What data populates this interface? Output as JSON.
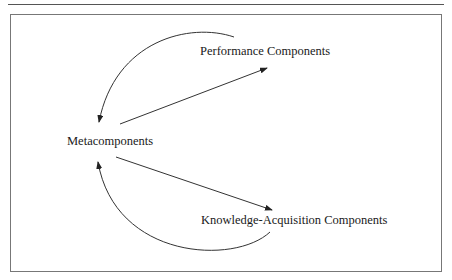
{
  "diagram": {
    "nodes": [
      {
        "id": "performance",
        "label": "Performance Components"
      },
      {
        "id": "meta",
        "label": "Metacomponents"
      },
      {
        "id": "knowledge",
        "label": "Knowledge-Acquisition Components"
      }
    ],
    "edges": [
      {
        "from": "meta",
        "to": "performance",
        "style": "straight"
      },
      {
        "from": "performance",
        "to": "meta",
        "style": "curved"
      },
      {
        "from": "meta",
        "to": "knowledge",
        "style": "straight"
      },
      {
        "from": "knowledge",
        "to": "meta",
        "style": "curved"
      }
    ],
    "colors": {
      "line": "#333333",
      "frame": "#777777",
      "text": "#1a1a1a"
    }
  }
}
